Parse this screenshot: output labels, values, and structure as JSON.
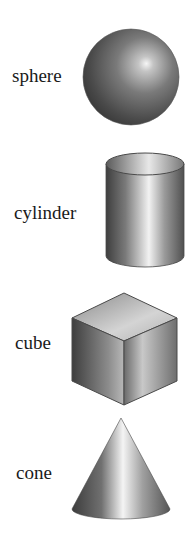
{
  "shapes": [
    {
      "name": "sphere",
      "label": "sphere"
    },
    {
      "name": "cylinder",
      "label": "cylinder"
    },
    {
      "name": "cube",
      "label": "cube"
    },
    {
      "name": "cone",
      "label": "cone"
    }
  ],
  "colors": {
    "background": "#ffffff",
    "label_text": "#1a1a1a",
    "shape_dark": "#3a3a3a",
    "shape_mid": "#8a8a8a",
    "shape_highlight": "#f4f4f4",
    "outline": "#4a4a4a"
  }
}
